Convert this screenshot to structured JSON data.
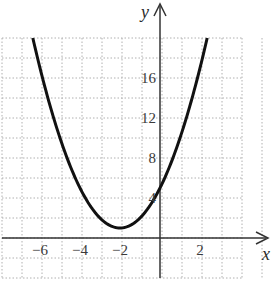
{
  "chart_data": {
    "type": "line",
    "title": "",
    "function": "y = (x + 2)^2 + 1",
    "xlabel": "x",
    "ylabel": "y",
    "x_ticks": [
      -6,
      -4,
      -2,
      2
    ],
    "x_tick_labels": [
      "−6",
      "−4",
      "−2",
      "2"
    ],
    "y_ticks": [
      4,
      8,
      12,
      16
    ],
    "y_tick_labels": [
      "4",
      "8",
      "12",
      "16"
    ],
    "xlim": [
      -8,
      4
    ],
    "ylim": [
      -4,
      20
    ],
    "grid": true,
    "grid_style": "dotted",
    "grid_step_x": 1,
    "grid_step_y": 2,
    "series": [
      {
        "name": "parabola",
        "vertex": [
          -2,
          1
        ],
        "x": [
          -6.36,
          -6,
          -5,
          -4,
          -3,
          -2,
          -1,
          0,
          1,
          2,
          2.36
        ],
        "y": [
          20,
          17,
          10,
          5,
          2,
          1,
          2,
          5,
          10,
          17,
          20
        ]
      }
    ],
    "colors": {
      "curve": "#111111",
      "axes": "#333333",
      "grid": "#b0b0b0"
    }
  }
}
